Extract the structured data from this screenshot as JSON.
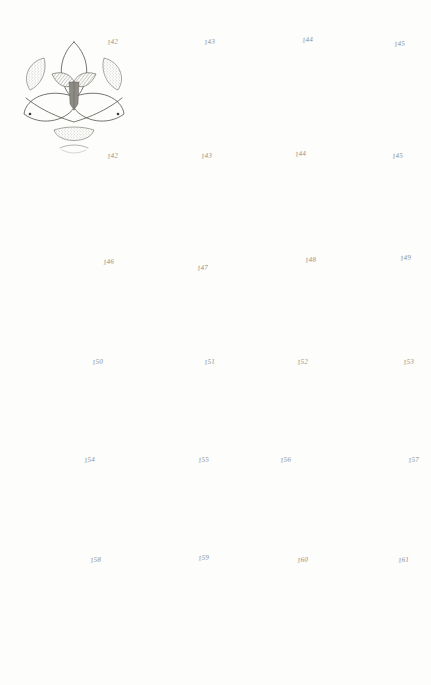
{
  "plate": {
    "title": "Floral Diagrams Plate",
    "kind": "botanical-illustration-plate",
    "background_color": "#fdfdfb",
    "ink_color": "#4a4742",
    "columns": 4,
    "rows": 6,
    "figure_count": 20,
    "figure_number_range": "142-161"
  },
  "figures": [
    {
      "id": "fig-142",
      "number": "142",
      "row": 1,
      "col": 1,
      "name": "three-parted floral diagram with bract",
      "description": "Triangular floral diagram, three outer perianth segments with stippled shading, central three-lobed ovary and dark elongated style, bract below"
    },
    {
      "id": "fig-143",
      "number": "143",
      "row": 1,
      "col": 2,
      "name": "eight-rayed floral diagram",
      "description": "Radial floral diagram with eight pointed perianth segments, four shaded inner lobes, open central ovary circle, cross axes"
    },
    {
      "id": "fig-144",
      "number": "144",
      "row": 1,
      "col": 3,
      "name": "six-rayed star floral diagram",
      "description": "Six stippled lanceolate perianth segments with inner dark six-pointed star and white circular ovary"
    },
    {
      "id": "fig-145",
      "number": "145",
      "row": 1,
      "col": 4,
      "name": "multi-whorled star diagram",
      "description": "Overlapping lanceolate segments in two whorls with fine inner star of stamens around small central ovary"
    },
    {
      "id": "fig-146b",
      "number": "142",
      "row": 2,
      "col": 1,
      "name": "zygomorphic three-petal flower",
      "description": "Orchid-like face view with two upper rounded hatched petals, lower lip, column with anthers at centre"
    },
    {
      "id": "fig-147b",
      "number": "143",
      "row": 2,
      "col": 2,
      "name": "four-petalled cruciform flower",
      "description": "Cruciferous flower with four broad obovate petals and a white cross-shaped centre over dark stamens"
    },
    {
      "id": "fig-148b",
      "number": "144",
      "row": 2,
      "col": 3,
      "name": "six-petalled flower with dark stamens",
      "description": "Six narrow notched petals with strong dark stamen wedges radiating from a pale round centre"
    },
    {
      "id": "fig-149b",
      "number": "145",
      "row": 2,
      "col": 4,
      "name": "five-petalled flower with ring eye",
      "description": "Five spaced obovate petals and a heavy dark annular corona at the centre"
    },
    {
      "id": "fig-146",
      "number": "146",
      "row": 3,
      "col": 1,
      "name": "three-petalled pansy-like flower",
      "description": "Three large overlapping rounded petals, two upper one lower, with stippled margins and tiny centre"
    },
    {
      "id": "fig-147",
      "number": "147",
      "row": 3,
      "col": 2,
      "name": "eight-petalled flower with granular disc",
      "description": "Eight narrow elliptic petals around a dense stippled circular disc of stamens"
    },
    {
      "id": "fig-148",
      "number": "148",
      "row": 3,
      "col": 3,
      "name": "five-petalled rose-like flower",
      "description": "Five broad overlapping petals with pointed sepals showing between, large dark granular centre"
    },
    {
      "id": "fig-149",
      "number": "149",
      "row": 3,
      "col": 4,
      "name": "five-lobed flower with five anthers",
      "description": "Shallowly five-lobed corolla with five solid black anthers and a white central ovary"
    },
    {
      "id": "fig-150",
      "number": "150",
      "row": 4,
      "col": 1,
      "name": "six-petalled flower with corona",
      "description": "Narcissus-like flower, six pointed perianth segments and a stippled ring corona around a pale centre"
    },
    {
      "id": "fig-151",
      "number": "151",
      "row": 4,
      "col": 2,
      "name": "ray flower with dark disc",
      "description": "Many strap-shaped ray florets around a broad dark annular disc with pale centre"
    },
    {
      "id": "fig-152",
      "number": "152",
      "row": 4,
      "col": 3,
      "name": "five-petalled notched flower",
      "description": "Five deeply notched heart-shaped petals with a small dark eye and five scale lobes"
    },
    {
      "id": "fig-153",
      "number": "153",
      "row": 4,
      "col": 4,
      "name": "cornflower-like capitulum",
      "description": "Spreading toothed ray florets with a bristly dark centre of disc florets"
    },
    {
      "id": "fig-154",
      "number": "154",
      "row": 5,
      "col": 1,
      "name": "three-sepal trillium-like flower",
      "description": "Three large shaded pointed sepals with three small white inner petals and a central ovary"
    },
    {
      "id": "fig-155",
      "number": "155",
      "row": 5,
      "col": 2,
      "name": "double ruffled flower",
      "description": "Many crinkled overlapping ruffled petals surrounding a small stippled centre with dark dots"
    },
    {
      "id": "fig-156",
      "number": "156",
      "row": 5,
      "col": 3,
      "name": "five-pointed star flower",
      "description": "Five narrow acute star-shaped segments with a ring of dark round anthers at the centre"
    },
    {
      "id": "fig-157",
      "number": "157",
      "row": 5,
      "col": 4,
      "name": "daisy capitulum",
      "description": "Numerous narrow ray florets around a very large stippled hemispherical disc"
    },
    {
      "id": "fig-158",
      "number": "158",
      "row": 6,
      "col": 1,
      "name": "six-tepal lily-like flower",
      "description": "Lily in three-quarter view with six recurved tepals, projecting style and dark anther"
    },
    {
      "id": "fig-159",
      "number": "159",
      "row": 6,
      "col": 2,
      "name": "cruciform compound diagram",
      "description": "Cross-shaped arrangement of four shaded star-lobed units on a vertical and horizontal axis with a small ringed centre"
    },
    {
      "id": "fig-160",
      "number": "160",
      "row": 6,
      "col": 3,
      "name": "five-angled funnel flower",
      "description": "Convolvulus-like funnel corolla with five shaded plaits radiating to the angles and a small ringed throat"
    },
    {
      "id": "fig-161",
      "number": "161",
      "row": 6,
      "col": 4,
      "name": "compound umbel",
      "description": "Rounded compound umbel of many small five-petalled white flowers with dark shaded interstices"
    }
  ],
  "figure_numbers_row1": [
    "142",
    "143",
    "144",
    "145"
  ],
  "figure_numbers_row2": [
    "142",
    "143",
    "144",
    "145"
  ],
  "figure_numbers_row3": [
    "146",
    "147",
    "148",
    "149"
  ],
  "figure_numbers_row4": [
    "150",
    "151",
    "152",
    "153"
  ],
  "figure_numbers_row5": [
    "154",
    "155",
    "156",
    "157"
  ],
  "figure_numbers_row6": [
    "158",
    "159",
    "160",
    "161"
  ]
}
